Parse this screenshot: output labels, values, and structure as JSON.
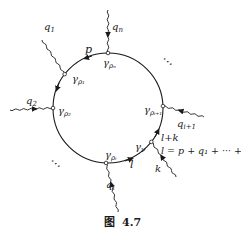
{
  "figure": {
    "caption_prefix": "图",
    "caption_number": "4.7",
    "loop": {
      "momentum_top": "p",
      "momentum_bottom": "l",
      "momentum_right": "l+k",
      "equation": "l = p + q₁ + ··· + qᵢ"
    },
    "vertices": [
      {
        "id": "gamma-rho-n",
        "label": "γ",
        "sub": "ρₙ"
      },
      {
        "id": "gamma-rho-1",
        "label": "γ",
        "sub": "ρ₁"
      },
      {
        "id": "gamma-rho-2",
        "label": "γ",
        "sub": "ρ₂"
      },
      {
        "id": "gamma-rho-i",
        "label": "γ",
        "sub": "ρᵢ"
      },
      {
        "id": "gamma-nu",
        "label": "γ",
        "sub": "ν"
      },
      {
        "id": "gamma-rho-i1",
        "label": "γ",
        "sub": "ρᵢ₊₁"
      }
    ],
    "external_lines": [
      {
        "id": "q-n",
        "label": "q",
        "sub": "n"
      },
      {
        "id": "q-1",
        "label": "q",
        "sub": "1"
      },
      {
        "id": "q-2",
        "label": "q",
        "sub": "2"
      },
      {
        "id": "q-i",
        "label": "q",
        "sub": "i"
      },
      {
        "id": "k",
        "label": "k",
        "sub": ""
      },
      {
        "id": "q-i1",
        "label": "q",
        "sub": "i+1"
      }
    ],
    "ellipsis": "⋯"
  }
}
